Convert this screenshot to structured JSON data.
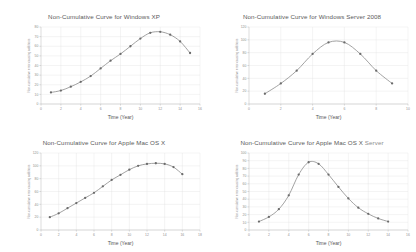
{
  "figure": {
    "background_color": "#ffffff",
    "grid_color": "#e3e3e3",
    "line_color": "#8a8a8a",
    "marker_color": "#6b6b6b",
    "title_color": "#5a5a5a",
    "layout": "2x2"
  },
  "charts": [
    {
      "id": "windows-xp",
      "title": "Non-Cumulative Curve for Windows XP",
      "title_suffix": "",
      "type": "line",
      "xlabel": "Time (Year)",
      "ylabel": "Non-cumulative error-causing additions",
      "xlim": [
        0,
        16
      ],
      "ylim": [
        0,
        80
      ],
      "xticks": [
        0,
        2,
        4,
        6,
        8,
        10,
        12,
        14,
        16
      ],
      "yticks": [
        0,
        10,
        20,
        30,
        40,
        50,
        60,
        70,
        80
      ],
      "grid": true,
      "legend": "none",
      "x": [
        1,
        2,
        3,
        4,
        5,
        6,
        7,
        8,
        9,
        10,
        11,
        12,
        13,
        14,
        15
      ],
      "values": [
        12,
        14,
        18,
        23,
        29,
        37,
        45,
        52,
        60,
        68,
        74,
        75,
        72,
        65,
        53
      ]
    },
    {
      "id": "windows-server-2008",
      "title": "Non-Cumulative Curve for Windows Server 2008",
      "title_suffix": "",
      "type": "line",
      "xlabel": "Time (Year)",
      "ylabel": "Non-cumulative error-causing additions",
      "xlim": [
        0,
        10
      ],
      "ylim": [
        0,
        120
      ],
      "xticks": [
        0,
        2,
        4,
        6,
        8,
        10
      ],
      "yticks": [
        0,
        20,
        40,
        60,
        80,
        100,
        120
      ],
      "grid": true,
      "legend": "none",
      "x": [
        1,
        2,
        3,
        4,
        5,
        6,
        7,
        8,
        9
      ],
      "values": [
        16,
        32,
        52,
        78,
        96,
        96,
        78,
        52,
        32
      ]
    },
    {
      "id": "apple-mac-os-x",
      "title": "Non-Cumulative Curve for Apple Mac OS X",
      "title_suffix": "",
      "type": "line",
      "xlabel": "Time (Year)",
      "ylabel": "Non-cumulative error-causing additions",
      "xlim": [
        0,
        18
      ],
      "ylim": [
        0,
        120
      ],
      "xticks": [
        0,
        2,
        4,
        6,
        8,
        10,
        12,
        14,
        16,
        18
      ],
      "yticks": [
        0,
        20,
        40,
        60,
        80,
        100,
        120
      ],
      "grid": true,
      "legend": "none",
      "x": [
        1,
        2,
        3,
        4,
        5,
        6,
        7,
        8,
        9,
        10,
        11,
        12,
        13,
        14,
        15,
        16
      ],
      "values": [
        20,
        26,
        34,
        42,
        50,
        58,
        68,
        78,
        86,
        94,
        100,
        103,
        104,
        103,
        98,
        87
      ]
    },
    {
      "id": "apple-mac-os-x-server",
      "title": "Non-Cumulative Curve for Apple Mac OS X",
      "title_suffix": "Server",
      "type": "line",
      "xlabel": "Time (Year)",
      "ylabel": "Non-cumulative error-causing additions",
      "xlim": [
        0,
        16
      ],
      "ylim": [
        0,
        100
      ],
      "xticks": [
        0,
        2,
        4,
        6,
        8,
        10,
        12,
        14,
        16
      ],
      "yticks": [
        0,
        10,
        20,
        30,
        40,
        50,
        60,
        70,
        80,
        90,
        100
      ],
      "grid": true,
      "legend": "none",
      "x": [
        1,
        2,
        3,
        4,
        5,
        6,
        7,
        8,
        9,
        10,
        11,
        12,
        13,
        14
      ],
      "values": [
        11,
        17,
        27,
        45,
        72,
        88,
        86,
        72,
        56,
        41,
        29,
        21,
        15,
        11
      ]
    }
  ],
  "chart_data": [
    {
      "type": "line",
      "title": "Non-Cumulative Curve for Windows XP",
      "xlabel": "Time (Year)",
      "ylabel": "Non-cumulative error-causing additions",
      "x": [
        1,
        2,
        3,
        4,
        5,
        6,
        7,
        8,
        9,
        10,
        11,
        12,
        13,
        14,
        15
      ],
      "values": [
        12,
        14,
        18,
        23,
        29,
        37,
        45,
        52,
        60,
        68,
        74,
        75,
        72,
        65,
        53
      ],
      "xlim": [
        0,
        16
      ],
      "ylim": [
        0,
        80
      ],
      "grid": true,
      "legend": "none"
    },
    {
      "type": "line",
      "title": "Non-Cumulative Curve for Windows Server 2008",
      "xlabel": "Time (Year)",
      "ylabel": "Non-cumulative error-causing additions",
      "x": [
        1,
        2,
        3,
        4,
        5,
        6,
        7,
        8,
        9
      ],
      "values": [
        16,
        32,
        52,
        78,
        96,
        96,
        78,
        52,
        32
      ],
      "xlim": [
        0,
        10
      ],
      "ylim": [
        0,
        120
      ],
      "grid": true,
      "legend": "none"
    },
    {
      "type": "line",
      "title": "Non-Cumulative Curve for Apple Mac OS X",
      "xlabel": "Time (Year)",
      "ylabel": "Non-cumulative error-causing additions",
      "x": [
        1,
        2,
        3,
        4,
        5,
        6,
        7,
        8,
        9,
        10,
        11,
        12,
        13,
        14,
        15,
        16
      ],
      "values": [
        20,
        26,
        34,
        42,
        50,
        58,
        68,
        78,
        86,
        94,
        100,
        103,
        104,
        103,
        98,
        87
      ],
      "xlim": [
        0,
        18
      ],
      "ylim": [
        0,
        120
      ],
      "grid": true,
      "legend": "none"
    },
    {
      "type": "line",
      "title": "Non-Cumulative Curve for Apple Mac OS X Server",
      "xlabel": "Time (Year)",
      "ylabel": "Non-cumulative error-causing additions",
      "x": [
        1,
        2,
        3,
        4,
        5,
        6,
        7,
        8,
        9,
        10,
        11,
        12,
        13,
        14
      ],
      "values": [
        11,
        17,
        27,
        45,
        72,
        88,
        86,
        72,
        56,
        41,
        29,
        21,
        15,
        11
      ],
      "xlim": [
        0,
        16
      ],
      "ylim": [
        0,
        100
      ],
      "grid": true,
      "legend": "none"
    }
  ]
}
